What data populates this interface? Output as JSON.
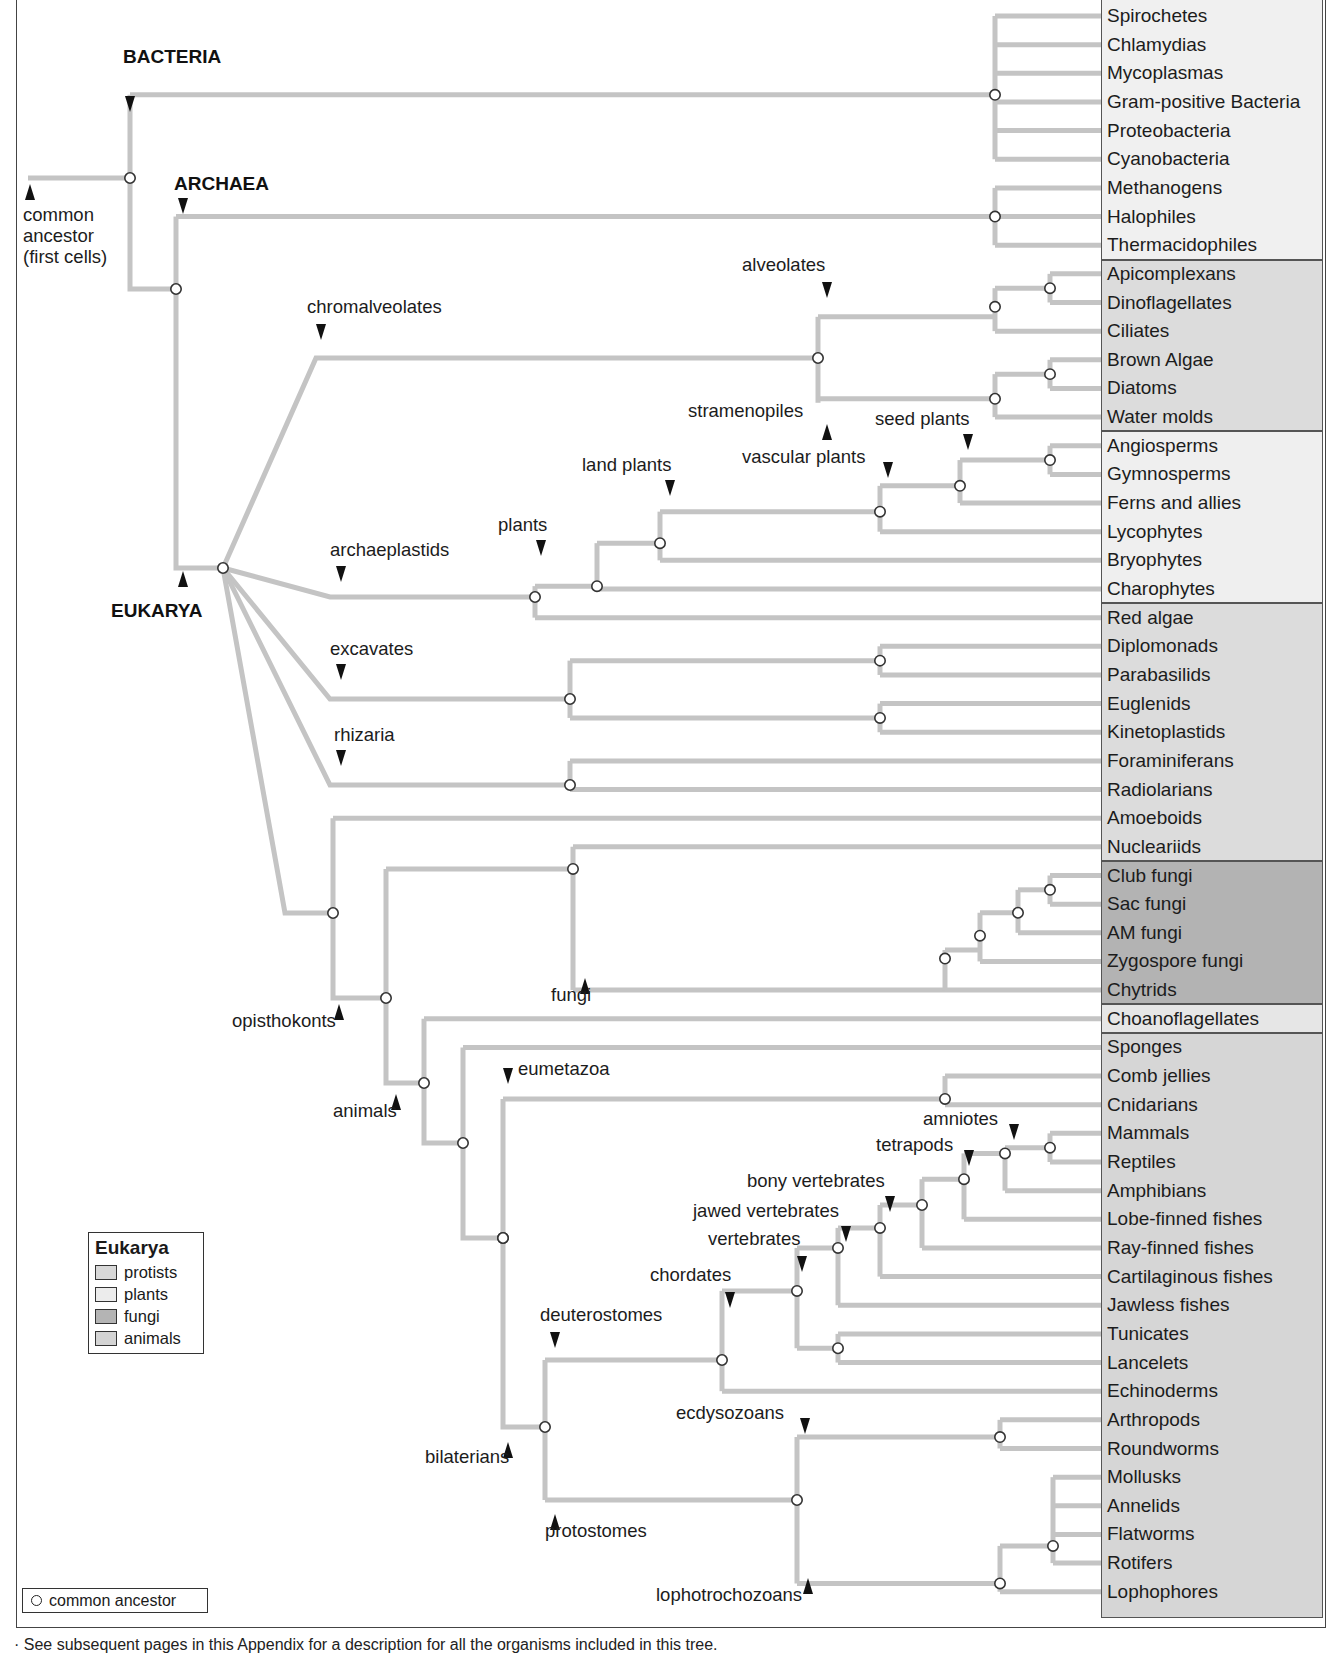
{
  "domains": {
    "bacteria": "BACTERIA",
    "archaea": "ARCHAEA",
    "eukarya": "EUKARYA"
  },
  "root_label": [
    "common",
    "ancestor",
    "(first cells)"
  ],
  "leaves": [
    {
      "name": "Spirochetes",
      "group": "bacteria"
    },
    {
      "name": "Chlamydias",
      "group": "bacteria"
    },
    {
      "name": "Mycoplasmas",
      "group": "bacteria"
    },
    {
      "name": "Gram-positive Bacteria",
      "group": "bacteria"
    },
    {
      "name": "Proteobacteria",
      "group": "bacteria"
    },
    {
      "name": "Cyanobacteria",
      "group": "bacteria"
    },
    {
      "name": "Methanogens",
      "group": "archaea"
    },
    {
      "name": "Halophiles",
      "group": "archaea"
    },
    {
      "name": "Thermacidophiles",
      "group": "archaea"
    },
    {
      "name": "Apicomplexans",
      "group": "protists"
    },
    {
      "name": "Dinoflagellates",
      "group": "protists"
    },
    {
      "name": "Ciliates",
      "group": "protists"
    },
    {
      "name": "Brown Algae",
      "group": "protists"
    },
    {
      "name": "Diatoms",
      "group": "protists"
    },
    {
      "name": "Water molds",
      "group": "protists"
    },
    {
      "name": "Angiosperms",
      "group": "plants"
    },
    {
      "name": "Gymnosperms",
      "group": "plants"
    },
    {
      "name": "Ferns and allies",
      "group": "plants"
    },
    {
      "name": "Lycophytes",
      "group": "plants"
    },
    {
      "name": "Bryophytes",
      "group": "plants"
    },
    {
      "name": "Charophytes",
      "group": "plants"
    },
    {
      "name": "Red algae",
      "group": "protists"
    },
    {
      "name": "Diplomonads",
      "group": "protists"
    },
    {
      "name": "Parabasilids",
      "group": "protists"
    },
    {
      "name": "Euglenids",
      "group": "protists"
    },
    {
      "name": "Kinetoplastids",
      "group": "protists"
    },
    {
      "name": "Foraminiferans",
      "group": "protists"
    },
    {
      "name": "Radiolarians",
      "group": "protists"
    },
    {
      "name": "Amoeboids",
      "group": "protists"
    },
    {
      "name": "Nucleariids",
      "group": "protists"
    },
    {
      "name": "Club fungi",
      "group": "fungi"
    },
    {
      "name": "Sac fungi",
      "group": "fungi"
    },
    {
      "name": "AM fungi",
      "group": "fungi"
    },
    {
      "name": "Zygospore fungi",
      "group": "fungi"
    },
    {
      "name": "Chytrids",
      "group": "fungi"
    },
    {
      "name": "Choanoflagellates",
      "group": "protists"
    },
    {
      "name": "Sponges",
      "group": "animals"
    },
    {
      "name": "Comb jellies",
      "group": "animals"
    },
    {
      "name": "Cnidarians",
      "group": "animals"
    },
    {
      "name": "Mammals",
      "group": "animals"
    },
    {
      "name": "Reptiles",
      "group": "animals"
    },
    {
      "name": "Amphibians",
      "group": "animals"
    },
    {
      "name": "Lobe-finned fishes",
      "group": "animals"
    },
    {
      "name": "Ray-finned fishes",
      "group": "animals"
    },
    {
      "name": "Cartilaginous fishes",
      "group": "animals"
    },
    {
      "name": "Jawless fishes",
      "group": "animals"
    },
    {
      "name": "Tunicates",
      "group": "animals"
    },
    {
      "name": "Lancelets",
      "group": "animals"
    },
    {
      "name": "Echinoderms",
      "group": "animals"
    },
    {
      "name": "Arthropods",
      "group": "animals"
    },
    {
      "name": "Roundworms",
      "group": "animals"
    },
    {
      "name": "Mollusks",
      "group": "animals"
    },
    {
      "name": "Annelids",
      "group": "animals"
    },
    {
      "name": "Flatworms",
      "group": "animals"
    },
    {
      "name": "Rotifers",
      "group": "animals"
    },
    {
      "name": "Lophophores",
      "group": "animals"
    }
  ],
  "clade_labels": [
    {
      "text": "chromalveolates",
      "x": 307,
      "y": 310,
      "arrow": "down",
      "ax": 321,
      "ay": 340
    },
    {
      "text": "alveolates",
      "x": 742,
      "y": 268,
      "arrow": "down",
      "ax": 827,
      "ay": 298
    },
    {
      "text": "stramenopiles",
      "x": 688,
      "y": 414,
      "arrow": "up-right",
      "ax": 827,
      "ay": 424
    },
    {
      "text": "seed plants",
      "x": 875,
      "y": 422,
      "arrow": "down",
      "ax": 968,
      "ay": 450
    },
    {
      "text": "vascular plants",
      "x": 742,
      "y": 460,
      "arrow": "down-right",
      "ax": 888,
      "ay": 478
    },
    {
      "text": "land plants",
      "x": 582,
      "y": 468,
      "arrow": "down",
      "ax": 670,
      "ay": 496
    },
    {
      "text": "plants",
      "x": 498,
      "y": 528,
      "arrow": "down",
      "ax": 541,
      "ay": 556
    },
    {
      "text": "archaeplastids",
      "x": 330,
      "y": 553,
      "arrow": "down",
      "ax": 341,
      "ay": 582
    },
    {
      "text": "excavates",
      "x": 330,
      "y": 652,
      "arrow": "down",
      "ax": 341,
      "ay": 680
    },
    {
      "text": "rhizaria",
      "x": 334,
      "y": 738,
      "arrow": "down",
      "ax": 341,
      "ay": 766
    },
    {
      "text": "fungi",
      "x": 551,
      "y": 998,
      "arrow": "up",
      "ax": 585,
      "ay": 978
    },
    {
      "text": "opisthokonts",
      "x": 232,
      "y": 1024,
      "arrow": "up",
      "ax": 339,
      "ay": 1004
    },
    {
      "text": "animals",
      "x": 333,
      "y": 1114,
      "arrow": "up",
      "ax": 396,
      "ay": 1094
    },
    {
      "text": "eumetazoa",
      "x": 518,
      "y": 1072,
      "arrow": "down-left",
      "ax": 508,
      "ay": 1084
    },
    {
      "text": "amniotes",
      "x": 923,
      "y": 1122,
      "arrow": "down-right",
      "ax": 1014,
      "ay": 1140
    },
    {
      "text": "tetrapods",
      "x": 876,
      "y": 1148,
      "arrow": "down-right",
      "ax": 969,
      "ay": 1166
    },
    {
      "text": "bony vertebrates",
      "x": 747,
      "y": 1184,
      "arrow": "down",
      "ax": 890,
      "ay": 1212
    },
    {
      "text": "jawed vertebrates",
      "x": 693,
      "y": 1214,
      "arrow": "down",
      "ax": 846,
      "ay": 1242
    },
    {
      "text": "vertebrates",
      "x": 708,
      "y": 1242,
      "arrow": "down",
      "ax": 802,
      "ay": 1272
    },
    {
      "text": "chordates",
      "x": 650,
      "y": 1278,
      "arrow": "down",
      "ax": 730,
      "ay": 1308
    },
    {
      "text": "deuterostomes",
      "x": 540,
      "y": 1318,
      "arrow": "down",
      "ax": 555,
      "ay": 1348
    },
    {
      "text": "ecdysozoans",
      "x": 676,
      "y": 1416,
      "arrow": "down-right",
      "ax": 805,
      "ay": 1434
    },
    {
      "text": "bilaterians",
      "x": 425,
      "y": 1460,
      "arrow": "up",
      "ax": 508,
      "ay": 1442
    },
    {
      "text": "protostomes",
      "x": 545,
      "y": 1534,
      "arrow": "up",
      "ax": 555,
      "ay": 1514
    },
    {
      "text": "lophotrochozoans",
      "x": 656,
      "y": 1598,
      "arrow": "up",
      "ax": 808,
      "ay": 1578
    }
  ],
  "legend": {
    "title": "Eukarya",
    "items": [
      {
        "label": "protists",
        "color": "#d8d8d8"
      },
      {
        "label": "plants",
        "color": "#ececec"
      },
      {
        "label": "fungi",
        "color": "#b4b4b4"
      },
      {
        "label": "animals",
        "color": "#d4d4d4"
      }
    ]
  },
  "ancestor_legend": "common ancestor",
  "footnote": "· See subsequent pages in this Appendix for a description for all the organisms included in this tree.",
  "colors": {
    "branch": "#c4c4c4",
    "node_fill": "#ffffff",
    "node_stroke": "#333333",
    "arrow": "#111111",
    "bacteria_archaea_panel": "#f0f0f0",
    "protists_panel": "#dcdcdc",
    "plants_panel": "#efefef",
    "fungi_panel": "#b3b3b3",
    "choano_panel": "#e6e6e6",
    "animals_panel": "#d6d6d6"
  }
}
